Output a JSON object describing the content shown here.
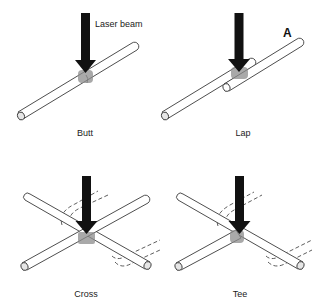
{
  "figure": {
    "annotation_laser": "Laser beam",
    "marker_a": "A",
    "panels": [
      {
        "id": "butt",
        "label": "Butt"
      },
      {
        "id": "lap",
        "label": "Lap"
      },
      {
        "id": "cross",
        "label": "Cross"
      },
      {
        "id": "tee",
        "label": "Tee"
      }
    ]
  },
  "colors": {
    "arrow": "#111111",
    "weld_zone": "#8c8c8c",
    "outline": "#3a3a3a",
    "background": "#ffffff"
  }
}
